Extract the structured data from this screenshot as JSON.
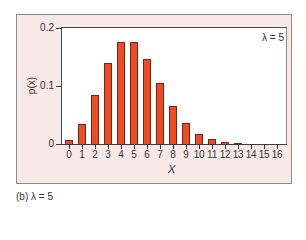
{
  "chart_data": {
    "type": "bar",
    "title": "",
    "annotation": "λ = 5",
    "xlabel": "X",
    "ylabel": "p(x)",
    "categories": [
      "0",
      "1",
      "2",
      "3",
      "4",
      "5",
      "6",
      "7",
      "8",
      "9",
      "10",
      "11",
      "12",
      "13",
      "14",
      "15",
      "16"
    ],
    "values": [
      0.0067,
      0.0337,
      0.0842,
      0.1404,
      0.1755,
      0.1755,
      0.1462,
      0.1044,
      0.0653,
      0.0363,
      0.0181,
      0.0082,
      0.0034,
      0.0013,
      0.0005,
      0.0002,
      0.0
    ],
    "ylim": [
      0,
      0.2
    ],
    "yticks": [
      0,
      0.1,
      0.2
    ],
    "ytick_labels": [
      "0",
      "0.1",
      "0.2"
    ],
    "grid": false,
    "legend": null,
    "bar_color": "#f04a22",
    "bar_edge_color": "#6b2a1a",
    "panel_background": "#f7e9e6"
  },
  "caption": "(b) λ = 5"
}
